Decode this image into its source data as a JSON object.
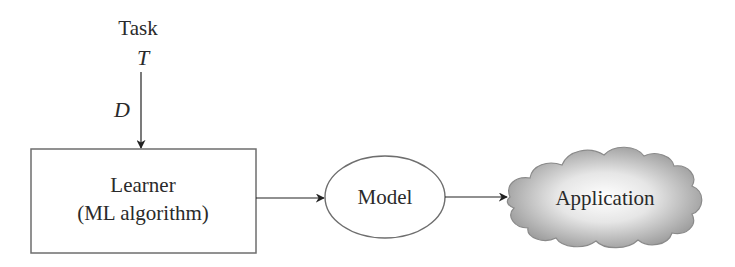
{
  "diagram": {
    "task": {
      "label": "Task",
      "symbol": "T"
    },
    "data_edge": {
      "label": "D"
    },
    "learner": {
      "line1": "Learner",
      "line2": "(ML algorithm)"
    },
    "model": {
      "label": "Model"
    },
    "application": {
      "label": "Application"
    },
    "edges": [
      {
        "from": "task",
        "to": "learner",
        "label": "D"
      },
      {
        "from": "learner",
        "to": "model",
        "label": ""
      },
      {
        "from": "model",
        "to": "application",
        "label": ""
      }
    ],
    "colors": {
      "stroke": "#6e6e6e",
      "text": "#2a2a2a",
      "arrow": "#222222",
      "cloud_center": "#ffffff",
      "cloud_edge": "#9a9a9a"
    }
  }
}
